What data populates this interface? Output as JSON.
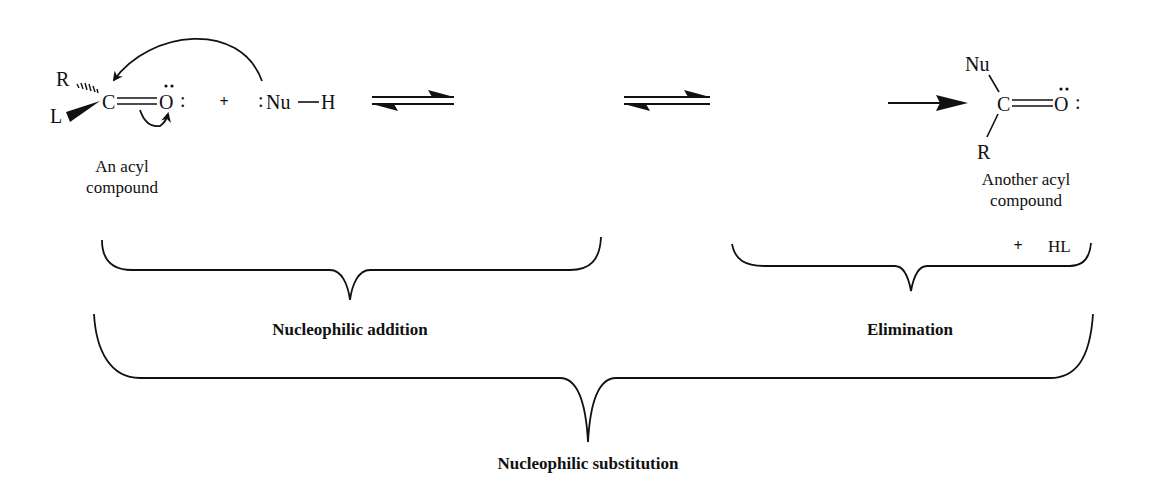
{
  "diagram": {
    "type": "reaction-mechanism",
    "reactants": {
      "acyl_compound": {
        "atoms": {
          "r": "R",
          "l": "L",
          "c": "C",
          "o": "O",
          "lone_pair_o": ":"
        },
        "caption_line1": "An acyl",
        "caption_line2": "compound"
      },
      "plus": "+",
      "nucleophile": {
        "lone_pair": ":",
        "nu": "Nu",
        "h": "H"
      }
    },
    "arrows": {
      "equilibrium_1": "⇌",
      "equilibrium_2": "⇌",
      "forward": "→"
    },
    "product": {
      "atoms": {
        "nu": "Nu",
        "r": "R",
        "c": "C",
        "o": "O",
        "lone_pair_o": ":"
      },
      "caption_line1": "Another acyl",
      "caption_line2": "compound",
      "byproduct_plus": "+",
      "byproduct": "HL"
    },
    "brace_labels": {
      "addition": "Nucleophilic addition",
      "elimination": "Elimination",
      "substitution": "Nucleophilic substitution"
    }
  }
}
